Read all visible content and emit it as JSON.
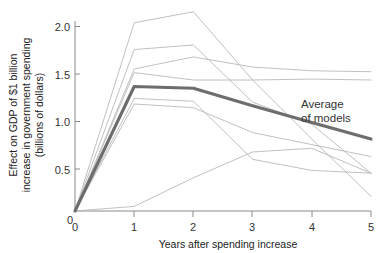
{
  "chart_data": {
    "type": "line",
    "title": "",
    "xlabel": "Years after spending increase",
    "ylabel": "Effect on GDP of $1 billion increase in government spending (billions of dollars)",
    "ylabel_lines": [
      "Effect on GDP of $1 billion",
      "increase in government spending",
      "(billions of dollars)"
    ],
    "x": [
      0,
      1,
      2,
      3,
      4,
      5
    ],
    "xlim": [
      0,
      5
    ],
    "ylim": [
      0,
      2.1
    ],
    "xticks": [
      "0",
      "1",
      "2",
      "3",
      "4",
      "5"
    ],
    "yticks": [
      "0",
      "0.5",
      "1.0",
      "1.5",
      "2.0"
    ],
    "ytick_values": [
      0,
      0.5,
      1.0,
      1.5,
      2.0
    ],
    "grid": false,
    "legend_position": "none",
    "annotations": [
      {
        "name": "average-of-models",
        "lines": [
          "Average",
          "of models"
        ],
        "x": 4.05,
        "y": 1.12
      }
    ],
    "series": [
      {
        "name": "model-1",
        "values": [
          0,
          2.04,
          2.16,
          1.42,
          0.78,
          0.16
        ],
        "style": "thin",
        "color": "#b9b9b9"
      },
      {
        "name": "model-2",
        "values": [
          0,
          1.75,
          1.8,
          1.18,
          0.94,
          0.41
        ],
        "style": "thin",
        "color": "#b9b9b9"
      },
      {
        "name": "model-3",
        "values": [
          0,
          1.54,
          1.67,
          1.56,
          1.52,
          1.51
        ],
        "style": "thin",
        "color": "#b9b9b9"
      },
      {
        "name": "model-4",
        "values": [
          0,
          1.5,
          1.42,
          1.42,
          1.43,
          1.42
        ],
        "style": "thin",
        "color": "#b9b9b9"
      },
      {
        "name": "model-5",
        "values": [
          0,
          1.22,
          1.19,
          0.56,
          0.44,
          0.41
        ],
        "style": "thin",
        "color": "#b9b9b9"
      },
      {
        "name": "model-6",
        "values": [
          0,
          1.16,
          1.12,
          0.85,
          0.72,
          0.59
        ],
        "style": "thin",
        "color": "#b9b9b9"
      },
      {
        "name": "model-7",
        "values": [
          0,
          0.05,
          0.36,
          0.64,
          0.68,
          0.41
        ],
        "style": "thin",
        "color": "#b9b9b9"
      },
      {
        "name": "Average of models",
        "values": [
          0,
          1.35,
          1.33,
          1.14,
          0.96,
          0.78
        ],
        "style": "thick",
        "color": "#6d6d6d"
      }
    ]
  },
  "axes": {
    "x_title": "Years after spending increase",
    "y_title_line1": "Effect on GDP of $1 billion",
    "y_title_line2": "increase in government spending",
    "y_title_line3": "(billions of dollars)",
    "x_tick_0": "0",
    "x_tick_1": "1",
    "x_tick_2": "2",
    "x_tick_3": "3",
    "x_tick_4": "4",
    "x_tick_5": "5",
    "y_tick_0": "0",
    "y_tick_1": "0.5",
    "y_tick_2": "1.0",
    "y_tick_3": "1.5",
    "y_tick_4": "2.0"
  },
  "annotation": {
    "line1": "Average",
    "line2": "of models"
  },
  "colors": {
    "background": "#ffffff",
    "axis": "#8a8a8a",
    "model_line": "#b9b9b9",
    "average_line": "#6d6d6d",
    "text": "#222222"
  }
}
